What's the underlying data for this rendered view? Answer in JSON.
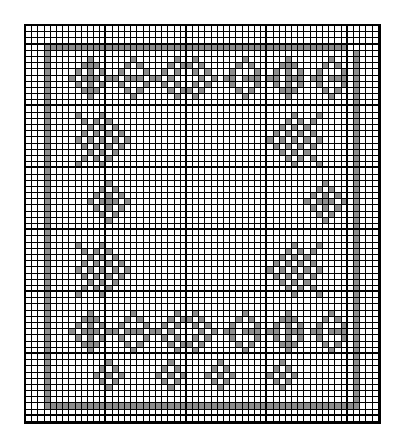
{
  "chart": {
    "title": "",
    "cols": 57,
    "rows": 64,
    "fill_color": "#8c8c8c",
    "line_color": "#000000",
    "background": "#ffffff",
    "thick_col_every": 13,
    "thick_col_offset": 0,
    "thick_row_every": 10,
    "thick_row_offset": 3,
    "pattern": [
      ".........................................................",
      ".........................................................",
      ".........................................................",
      "...#################################################.....",
      "...#.................................................#...",
      "...#......#......#......#..#.......#......#......#...#...",
      "...#.....###....#.#....#.##.#.....#.#....###....#.#..#...",
      "...#....#.#.#..#...#..#.#..#.#...#...#..#.#.#..#...#.#...",
      "...#...#.###.##.###.##.#....#.#.##.###.##.###.##.###.#...",
      "...#....#.#.#..#...#..#.#..#.#...#...#..#.#.#..#...#.#...",
      "...#.....###....#.#....#.##.#.....#.#....###....#.#..#...",
      "...#......#......#......#..#.......#......#......#...#...",
      "...#.................................................#...",
      "...#.................................................#...",
      "...#....#...#..............................#...#.....#...",
      "...#.....#.#.#............................#.#.#......#...",
      "...#......#.#.#..........................#.#.#.......#...",
      "...#.....#.#.#.#........................#.#.#.#......#...",
      "...#....#.#.#.#.#......................#.#.#.#.#.....#...",
      "...#.....#.#.#.#........................#.#.#.#......#...",
      "...#......#.#.#..........................#.#.#.......#...",
      "...#.....#.#.#............................#.#.#......#...",
      "...#....#...#..............................#...#.....#...",
      "...#.................................................#...",
      "...#.................................................#...",
      "...#.........#..................................#....#...",
      "...#........#.#................................#.#...#...",
      "...#.......#.#.#..............................#.#.#..#...",
      "...#......#.###.#............................#.###.#.#...",
      "...#.......#.#.#..............................#.#.#..#...",
      "...#........#.#................................#.#...#...",
      "...#.........#..................................#....#...",
      "...#.................................................#...",
      "...#.................................................#...",
      "...#.................................................#...",
      "...#....#...#..............................#...#.....#...",
      "...#.....#.#.#............................#.#.#......#...",
      "...#......#.#.#..........................#.#.#.......#...",
      "...#.....#.#.#.#........................#.#.#.#......#...",
      "...#....#.#.#.#.#......................#.#.#.#.#.....#...",
      "...#.....#.#.#.#........................#.#.#.#......#...",
      "...#......#.#.#..........................#.#.#.......#...",
      "...#.....#.#.#............................#.#.#......#...",
      "...#....#...#..............................#...#.....#...",
      "...#.................................................#...",
      "...#.................................................#...",
      "...#......#......#......#..#.......#......#......#...#...",
      "...#.....###....#.#....#.##.#.....#.#....###....#.#..#...",
      "...#....#.#.#..#...#..#.#..#.#...#...#..#.#.#..#...#.#...",
      "...#...#.###.##.###.##.#....#.#.##.###.##.###.##.###.#...",
      "...#....#.#.#..#...#..#.#..#.#...#...#..#.#.#..#...#.#...",
      "...#.....###....#.#....#.##.#.....#.#....###....#.#..#...",
      "...#......#......#......#..#.......#......#......#...#...",
      "...#.................................................#...",
      "...#.........#.........#.......#.........#...........#...",
      "...#........#.#.......#.#.....#.#.......#.#..........#...",
      "...#.......#.#.#.....#.#.#...#.#.#.....#.#.#.........#...",
      "...#........#.#.......#.#.....#.#.......#.#..........#...",
      "...#.........#.........#.......#.........#...........#...",
      "...#.................................................#...",
      "...#.................................................#...",
      "...###################################################...",
      ".........................................................",
      "........................................................."
    ]
  }
}
